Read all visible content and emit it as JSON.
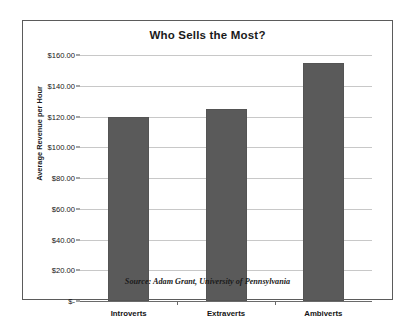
{
  "chart_data": {
    "type": "bar",
    "title": "Who Sells the Most?",
    "categories": [
      "Introverts",
      "Extraverts",
      "Ambiverts"
    ],
    "values": [
      120,
      125,
      155
    ],
    "xlabel": "",
    "ylabel": "Average Revenue per Hour",
    "ylim": [
      0,
      160
    ],
    "ytick_values": [
      0,
      20,
      40,
      60,
      80,
      100,
      120,
      140,
      160
    ],
    "ytick_labels": [
      "$-",
      "$20.00",
      "$40.00",
      "$60.00",
      "$80.00",
      "$100.00",
      "$120.00",
      "$140.00",
      "$160.00"
    ],
    "grid": true,
    "legend": false,
    "legend_position": "none",
    "annotation": "Source: Adam Grant, University of Pennsylvania",
    "bar_color": "#5a5a5a",
    "gridline_color": "#c8c8c8",
    "axis_color": "#6a6a6a",
    "frame_color": "#5b5b5b",
    "background_color": "#ffffff"
  }
}
